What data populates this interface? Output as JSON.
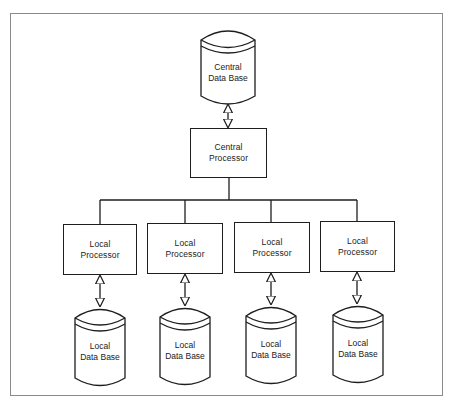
{
  "diagram": {
    "type": "hierarchical-distributed-database",
    "central": {
      "database": {
        "line1": "Central",
        "line2": "Data Base"
      },
      "processor": {
        "line1": "Central",
        "line2": "Processor"
      }
    },
    "locals": [
      {
        "processor": {
          "line1": "Local",
          "line2": "Processor"
        },
        "database": {
          "line1": "Local",
          "line2": "Data Base"
        }
      },
      {
        "processor": {
          "line1": "Local",
          "line2": "Processor"
        },
        "database": {
          "line1": "Local",
          "line2": "Data Base"
        }
      },
      {
        "processor": {
          "line1": "Local",
          "line2": "Processor"
        },
        "database": {
          "line1": "Local",
          "line2": "Data Base"
        }
      },
      {
        "processor": {
          "line1": "Local",
          "line2": "Processor"
        },
        "database": {
          "line1": "Local",
          "line2": "Data Base"
        }
      }
    ],
    "colors": {
      "stroke": "#1e1e1e",
      "frame": "#8a8a8a",
      "background": "#ffffff"
    }
  }
}
